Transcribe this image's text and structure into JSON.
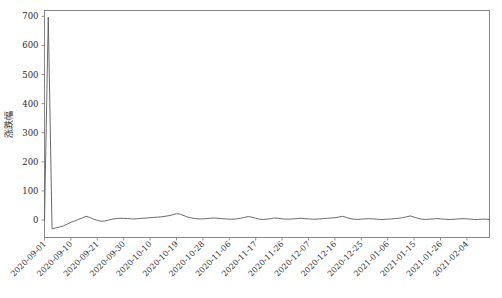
{
  "chart_data": {
    "type": "line",
    "title": "",
    "xlabel": "",
    "ylabel": "涨跌幅",
    "ylim": [
      -60,
      720
    ],
    "yticks": [
      0,
      100,
      200,
      300,
      400,
      500,
      600,
      700
    ],
    "ytick_labels": [
      "0",
      "100",
      "200",
      "300",
      "400",
      "500",
      "600",
      "700"
    ],
    "grid": false,
    "legend": null,
    "line_color": "#5a5a5a",
    "axis_color": "#7a7a7a",
    "xtick_labels": [
      "2020-09-01",
      "2020-09-10",
      "2020-09-21",
      "2020-09-30",
      "2020-10-10",
      "2020-10-19",
      "2020-10-28",
      "2020-11-06",
      "2020-11-17",
      "2020-11-26",
      "2020-12-07",
      "2020-12-16",
      "2020-12-25",
      "2021-01-06",
      "2021-01-15",
      "2021-01-26",
      "2021-02-04"
    ],
    "xtick_indices": [
      0,
      7,
      14,
      21,
      28,
      35,
      42,
      49,
      56,
      63,
      70,
      77,
      84,
      91,
      98,
      105,
      112
    ],
    "x": [
      0,
      1,
      2,
      3,
      4,
      5,
      6,
      7,
      8,
      9,
      10,
      11,
      12,
      13,
      14,
      15,
      16,
      17,
      18,
      19,
      20,
      21,
      22,
      23,
      24,
      25,
      26,
      27,
      28,
      29,
      30,
      31,
      32,
      33,
      34,
      35,
      36,
      37,
      38,
      39,
      40,
      41,
      42,
      43,
      44,
      45,
      46,
      47,
      48,
      49,
      50,
      51,
      52,
      53,
      54,
      55,
      56,
      57,
      58,
      59,
      60,
      61,
      62,
      63,
      64,
      65,
      66,
      67,
      68,
      69,
      70,
      71,
      72,
      73,
      74,
      75,
      76,
      77,
      78,
      79,
      80,
      81,
      82,
      83,
      84,
      85,
      86,
      87,
      88,
      89,
      90,
      91,
      92,
      93,
      94,
      95,
      96,
      97,
      98,
      99,
      100,
      101,
      102,
      103,
      104,
      105,
      106,
      107,
      108,
      109,
      110,
      111,
      112,
      113,
      114,
      115,
      116,
      117,
      118
    ],
    "values": [
      0,
      697,
      -30,
      -27,
      -24,
      -20,
      -14,
      -8,
      -3,
      2,
      7,
      13,
      9,
      3,
      -1,
      -4,
      -3,
      0,
      3,
      5,
      6,
      6,
      5,
      4,
      4,
      5,
      6,
      7,
      8,
      9,
      10,
      11,
      13,
      15,
      18,
      22,
      20,
      15,
      10,
      7,
      5,
      4,
      4,
      5,
      6,
      7,
      6,
      5,
      4,
      3,
      3,
      4,
      6,
      9,
      12,
      10,
      6,
      3,
      2,
      3,
      5,
      7,
      6,
      4,
      3,
      3,
      4,
      5,
      6,
      5,
      4,
      3,
      3,
      4,
      5,
      6,
      7,
      8,
      10,
      13,
      9,
      5,
      3,
      2,
      3,
      4,
      5,
      4,
      3,
      2,
      2,
      3,
      4,
      5,
      6,
      8,
      11,
      14,
      10,
      6,
      3,
      2,
      3,
      4,
      5,
      4,
      3,
      2,
      2,
      3,
      4,
      5,
      4,
      3,
      2,
      2,
      3,
      3,
      2
    ],
    "series_name": "涨跌幅"
  }
}
